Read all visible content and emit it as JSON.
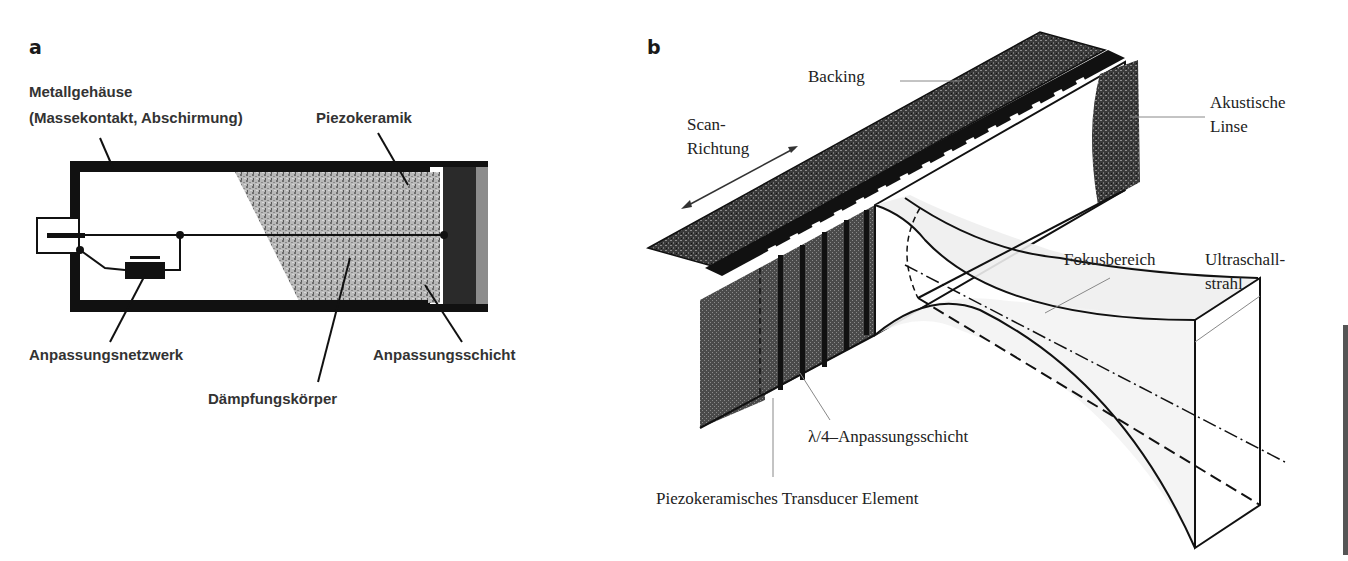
{
  "figure": {
    "panel_a": {
      "label": "a",
      "title_line1": "Metallgehäuse",
      "title_line2": "(Massekontakt, Abschirmung)",
      "labels": {
        "piezo": "Piezokeramik",
        "network": "Anpassungsnetzwerk",
        "damping": "Dämpfungskörper",
        "matching_layer": "Anpassungsschicht"
      }
    },
    "panel_b": {
      "label": "b",
      "labels": {
        "backing": "Backing",
        "scan_line1": "Scan-",
        "scan_line2": "Richtung",
        "lens_line1": "Akustische",
        "lens_line2": "Linse",
        "focus": "Fokusbereich",
        "beam_line1": "Ultraschall-",
        "beam_line2": "strahl",
        "lambda_layer": "λ/4–Anpassungsschicht",
        "transducer": "Piezokeramisches Transducer Element"
      }
    },
    "colors": {
      "ink": "#111111",
      "speckle": "#9a9a9a",
      "piezo": "#2a2a2a",
      "matching": "#8c8c8c",
      "leader": "#888888"
    }
  }
}
